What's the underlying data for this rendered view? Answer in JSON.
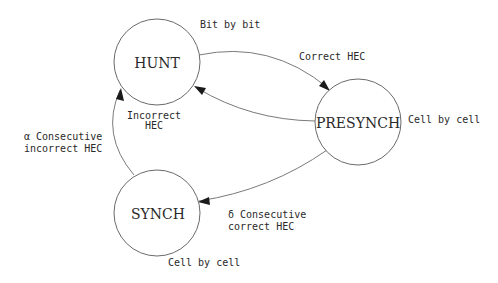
{
  "diagram": {
    "type": "state-machine",
    "states": [
      {
        "id": "hunt",
        "label": "HUNT",
        "note": "Bit by bit"
      },
      {
        "id": "presynch",
        "label": "PRESYNCH",
        "note": "Cell by cell"
      },
      {
        "id": "synch",
        "label": "SYNCH",
        "note": "Cell by cell"
      }
    ],
    "transitions": [
      {
        "from": "hunt",
        "to": "presynch",
        "label_lines": [
          "Correct HEC"
        ]
      },
      {
        "from": "presynch",
        "to": "hunt",
        "label_lines": [
          "Incorrect",
          "HEC"
        ]
      },
      {
        "from": "presynch",
        "to": "synch",
        "label_lines": [
          "δ Consecutive",
          "correct HEC"
        ]
      },
      {
        "from": "synch",
        "to": "hunt",
        "label_lines": [
          "α Consecutive",
          "incorrect HEC"
        ]
      }
    ]
  }
}
